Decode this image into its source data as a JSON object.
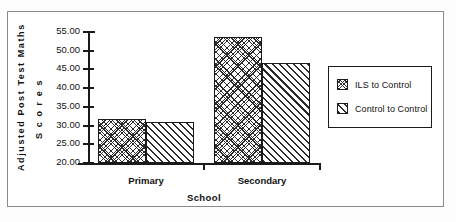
{
  "chart_data": {
    "type": "bar",
    "title": "",
    "subtitle": "",
    "xlabel": "School",
    "ylabel": "Adjusted Post Test Maths Scores",
    "ylabel_lines": [
      "Adjusted  Post  Test  Maths",
      "S c o r e s"
    ],
    "categories": [
      "Primary",
      "Secondary"
    ],
    "series": [
      {
        "name": "ILS to Control",
        "pattern": "crosshatch",
        "values": [
          31.7,
          53.7
        ]
      },
      {
        "name": "Control to Control",
        "pattern": "diagonal-hatch",
        "values": [
          31.0,
          46.8
        ]
      }
    ],
    "ylim": [
      20.0,
      55.0
    ],
    "ytick_step": 5.0,
    "ytick_labels": [
      "55.00",
      "50.00",
      "45.00",
      "40.00",
      "35.00",
      "30.00",
      "25.00",
      "20.00"
    ],
    "ytick_values": [
      55.0,
      50.0,
      45.0,
      40.0,
      35.0,
      30.0,
      25.0,
      20.0
    ],
    "grid": false,
    "legend_position": "right",
    "legend_entries": [
      "ILS to Control",
      "Control to Control"
    ],
    "colors": {
      "ink": "#1a1a1a",
      "frame": "#8a8a8a",
      "background": "#ffffff"
    }
  }
}
